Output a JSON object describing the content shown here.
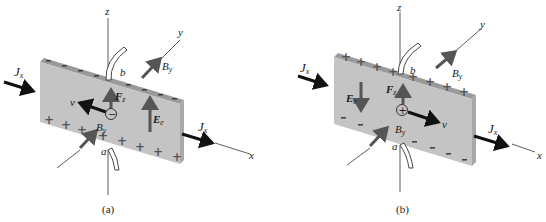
{
  "figure": {
    "colors": {
      "plate_face": "#c4c4c4",
      "plate_top_edge": "#9a9a9a",
      "plate_side_edge": "#a8a8a8",
      "current_arrow": "#111111",
      "field_arrow": "#555555",
      "axis": "#333333"
    },
    "panels": [
      {
        "id": "a",
        "caption": "(a)",
        "carrier_sign": "−",
        "top_edge_charge": "−",
        "bottom_face_charge": "+",
        "labels": {
          "axis_x": "x",
          "axis_y": "y",
          "axis_z": "z",
          "current_in": "J",
          "current_in_sub": "x",
          "current_out": "J",
          "current_out_sub": "x",
          "b_field_back": "B",
          "b_field_back_sub": "y",
          "b_field_front": "B",
          "b_field_front_sub": "y",
          "force": "F",
          "force_sub": "z",
          "velocity": "v",
          "hall_field": "E",
          "hall_field_sub": "e",
          "probe_top": "b",
          "probe_bottom": "a"
        },
        "velocity_direction": "-x",
        "hall_field_direction": "+z",
        "force_direction": "+z"
      },
      {
        "id": "b",
        "caption": "(b)",
        "carrier_sign": "+",
        "top_edge_charge": "+",
        "bottom_face_charge": "−",
        "labels": {
          "axis_x": "x",
          "axis_y": "y",
          "axis_z": "z",
          "current_in": "J",
          "current_in_sub": "x",
          "current_out": "J",
          "current_out_sub": "x",
          "b_field_back": "B",
          "b_field_back_sub": "y",
          "b_field_front": "B",
          "b_field_front_sub": "y",
          "force": "F",
          "force_sub": "z",
          "velocity": "v",
          "hall_field": "E",
          "hall_field_sub": "e",
          "probe_top": "b",
          "probe_bottom": "a"
        },
        "velocity_direction": "+x",
        "hall_field_direction": "-z",
        "force_direction": "+z"
      }
    ]
  }
}
